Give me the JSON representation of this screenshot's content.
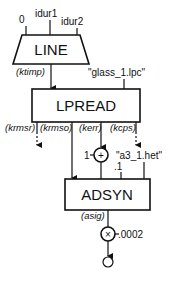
{
  "diagram": {
    "type": "signal-flow",
    "nodes": {
      "line": {
        "label": "LINE",
        "inputs": [
          "0",
          "idur1",
          "idur2"
        ],
        "output": "(ktimp)"
      },
      "lpread": {
        "label": "LPREAD",
        "file_arg": "\"glass_1.lpc\"",
        "outputs": [
          "(krmsr)",
          "(krmso)",
          "(kerr)",
          "(kcps)"
        ]
      },
      "adder": {
        "symbol": "+",
        "input_const": "1"
      },
      "adsyn": {
        "label": "ADSYN",
        "file_arg": "\"a3_1.het\"",
        "const_arg": ".1",
        "output": "(asig)"
      },
      "multiplier": {
        "symbol": "×",
        "const_arg": ".0002"
      }
    },
    "colors": {
      "line": "#111111",
      "background": "#ffffff"
    }
  }
}
